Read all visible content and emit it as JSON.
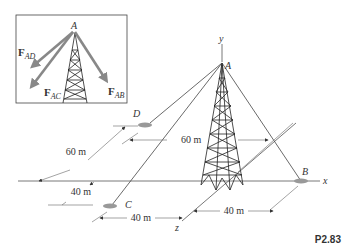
{
  "figure": {
    "problem_number": "P2.83",
    "points": {
      "A": "A",
      "B": "B",
      "C": "C",
      "D": "D"
    },
    "axes": {
      "x": "x",
      "y": "y",
      "z": "z"
    },
    "dimensions": {
      "d_60_left": "60 m",
      "d_60_mid": "60 m",
      "d_40_left": "40 m",
      "d_40_bottom_left": "40 m",
      "d_40_bottom_right": "40 m"
    },
    "inset": {
      "point": "A",
      "forces": [
        {
          "bold": "F",
          "sub": "AD"
        },
        {
          "bold": "F",
          "sub": "AC"
        },
        {
          "bold": "F",
          "sub": "AB"
        }
      ]
    }
  },
  "colors": {
    "force_arrow": "#888888",
    "anchor": "#999999",
    "line": "#444444"
  }
}
